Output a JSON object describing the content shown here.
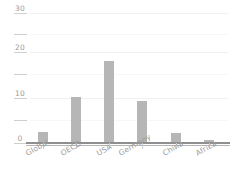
{
  "chart_data": {
    "type": "bar",
    "title": "",
    "subtitle": "",
    "xlabel": "",
    "ylabel": "",
    "categories": [
      "Global",
      "OECD",
      "USA",
      "Germany",
      "China",
      "Africa"
    ],
    "values": [
      2.5,
      10.6,
      19.0,
      9.8,
      2.3,
      0.8
    ],
    "series": [
      {
        "name": "",
        "values": [
          2.5,
          10.6,
          19.0,
          9.8,
          2.3,
          0.8
        ]
      }
    ],
    "ylim": [
      0,
      30
    ],
    "ytick_values": [
      0,
      5,
      10,
      15,
      20,
      25,
      30
    ],
    "ytick_labels": [
      "0",
      "",
      "10",
      "",
      "20",
      "",
      "30"
    ],
    "grid": true,
    "grid_axis": "y",
    "legend": false,
    "legend_position": "none",
    "annotations": [],
    "colors": {
      "bar": "#b6b6b6",
      "gridline": "#f0f0f0",
      "baseline": "#8f8f8f",
      "tick": "#cfcfcf",
      "text": "#9a9a9a",
      "background": "#ffffff"
    }
  }
}
